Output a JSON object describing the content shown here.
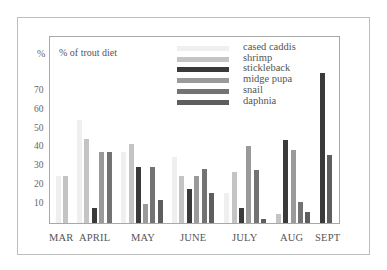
{
  "chart_data": {
    "type": "bar",
    "title": "% of trout diet",
    "xlabel": "",
    "ylabel": "%",
    "ylim": [
      0,
      85
    ],
    "yticks": [
      10,
      20,
      30,
      40,
      50,
      60,
      70
    ],
    "grid": false,
    "legend_position": "top-right inside plot",
    "categories": [
      "MAR",
      "APRIL",
      "MAY",
      "JUNE",
      "JULY",
      "AUG",
      "SEPT"
    ],
    "series": [
      {
        "name": "cased caddis",
        "color": "#efefef",
        "values": [
          25,
          55,
          38,
          35,
          16,
          0,
          0
        ]
      },
      {
        "name": "shrimp",
        "color": "#c4c4c4",
        "values": [
          25,
          45,
          42,
          25,
          27,
          5,
          0
        ]
      },
      {
        "name": "stickleback",
        "color": "#3a3a3a",
        "values": [
          0,
          8,
          30,
          18,
          8,
          44,
          80
        ]
      },
      {
        "name": "midge pupa",
        "color": "#9a9a9a",
        "values": [
          0,
          38,
          10,
          25,
          41,
          39,
          0
        ]
      },
      {
        "name": "snail",
        "color": "#737373",
        "values": [
          0,
          38,
          30,
          29,
          28,
          11,
          0
        ]
      },
      {
        "name": "daphnia",
        "color": "#5e5e5e",
        "values": [
          0,
          0,
          12,
          16,
          2,
          6,
          36
        ]
      }
    ]
  },
  "labels": {
    "unit": "%",
    "title": "% of trout diet",
    "yticks": [
      "70",
      "60",
      "50",
      "40",
      "30",
      "20",
      "10"
    ],
    "xticks": [
      "MAR",
      "APRIL",
      "MAY",
      "JUNE",
      "JULY",
      "AUG",
      "SEPT"
    ],
    "legend": [
      "cased caddis",
      "shrimp",
      "stickleback",
      "midge pupa",
      "snail",
      "daphnia"
    ]
  }
}
